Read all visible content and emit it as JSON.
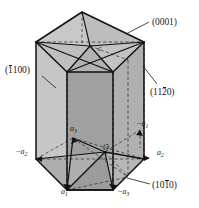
{
  "figure": {
    "type": "crystallographic-diagram",
    "background_color": "#ffffff",
    "line_color": "#1a1a1a"
  },
  "colors": {
    "face_light": "#c9c9c9",
    "face_mid": "#b4b4b4",
    "face_dark": "#9e9e9e",
    "face_darkest": "#8f8f8f",
    "top_light": "#cfcfcf",
    "outline": "#1a1a1a",
    "dashed": "#2a2a2a"
  },
  "plane_labels": [
    {
      "id": "basal-plane",
      "open": "(",
      "parts": [
        {
          "text": "0",
          "overbar": false
        },
        {
          "text": "0",
          "overbar": false
        },
        {
          "text": "0",
          "overbar": false
        },
        {
          "text": "1",
          "overbar": false
        }
      ],
      "close": ")",
      "plain": "(0001)",
      "x": 152,
      "y": 18
    },
    {
      "id": "prism-plane-1100",
      "open": "(",
      "parts": [
        {
          "text": "1",
          "overbar": true
        },
        {
          "text": "1",
          "overbar": false
        },
        {
          "text": "0",
          "overbar": false
        },
        {
          "text": "0",
          "overbar": false
        }
      ],
      "close": ")",
      "plain": "(1100)",
      "x": 5,
      "y": 66
    },
    {
      "id": "prism-plane-1120",
      "open": "(",
      "parts": [
        {
          "text": "1",
          "overbar": false
        },
        {
          "text": "1",
          "overbar": false
        },
        {
          "text": "2",
          "overbar": true
        },
        {
          "text": "0",
          "overbar": false
        }
      ],
      "close": ")",
      "plain": "(1120)",
      "x": 150,
      "y": 88
    },
    {
      "id": "prism-plane-1010",
      "open": "(",
      "parts": [
        {
          "text": "1",
          "overbar": false
        },
        {
          "text": "0",
          "overbar": false
        },
        {
          "text": "1",
          "overbar": true
        },
        {
          "text": "0",
          "overbar": false
        }
      ],
      "close": ")",
      "plain": "(1010)",
      "x": 152,
      "y": 181
    }
  ],
  "axis_labels": [
    {
      "id": "axis-c",
      "prefix": "",
      "base": "c",
      "sub": "",
      "x": 98,
      "y": 49
    },
    {
      "id": "axis-a3-pos",
      "prefix": "",
      "base": "a",
      "sub": "3",
      "x": 70,
      "y": 129
    },
    {
      "id": "axis-a1-neg",
      "prefix": "−",
      "base": "a",
      "sub": "1",
      "x": 137,
      "y": 124
    },
    {
      "id": "axis-a2-neg",
      "prefix": "−",
      "base": "a",
      "sub": "2",
      "x": 16,
      "y": 152
    },
    {
      "id": "axis-a2-pos",
      "prefix": "",
      "base": "a",
      "sub": "2",
      "x": 157,
      "y": 153
    },
    {
      "id": "axis-a1-pos",
      "prefix": "",
      "base": "a",
      "sub": "1",
      "x": 61,
      "y": 192
    },
    {
      "id": "axis-a3-neg",
      "prefix": "−",
      "base": "a",
      "sub": "3",
      "x": 118,
      "y": 192
    },
    {
      "id": "origin",
      "prefix": "",
      "base": "O",
      "sub": "",
      "x": 103,
      "y": 148
    }
  ],
  "leader_lines": [
    {
      "id": "leader-0001",
      "from": [
        150,
        22
      ],
      "to": [
        128,
        33
      ]
    },
    {
      "id": "leader-1100",
      "from": [
        44,
        75
      ],
      "to": [
        56,
        87
      ]
    },
    {
      "id": "leader-1120",
      "from": [
        156,
        85
      ],
      "to": [
        144,
        68
      ]
    },
    {
      "id": "leader-1010",
      "from": [
        150,
        184
      ],
      "to": [
        128,
        177
      ]
    }
  ]
}
